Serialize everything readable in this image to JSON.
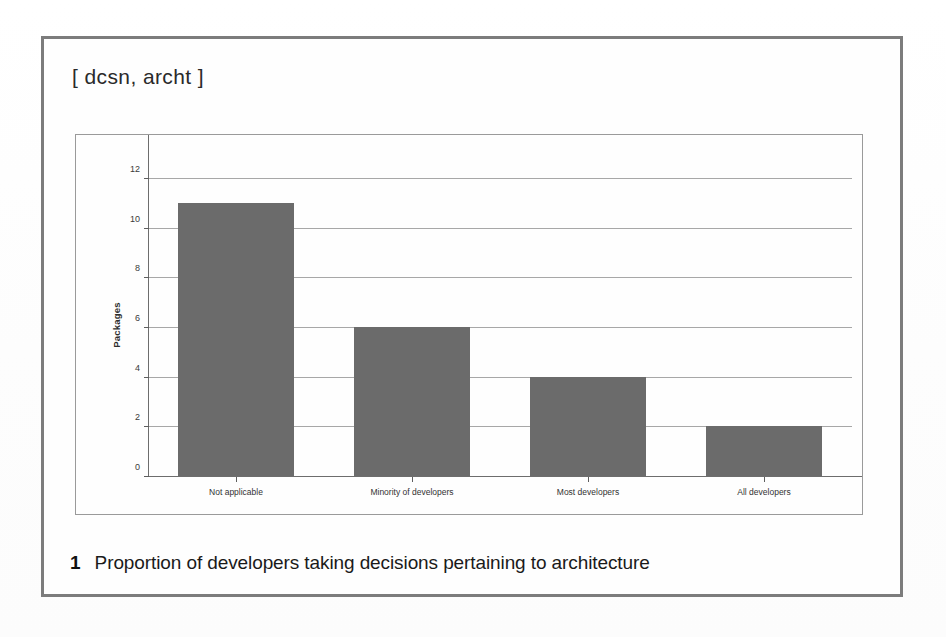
{
  "figure": {
    "bracket_label": "[ dcsn, archt ]",
    "caption_number": "1",
    "caption_text": "Proportion of developers taking decisions pertaining to architecture"
  },
  "colors": {
    "bar_fill": "#6b6b6b",
    "frame_border": "#7c7c7c",
    "chart_border": "#9a9a9a",
    "gridline": "#a7a7a7",
    "axis": "#6d6d6d",
    "page_background": "#ffffff"
  },
  "chart_data": {
    "type": "bar",
    "title": "",
    "subtitle": "",
    "categories": [
      "Not applicable",
      "Minority of developers",
      "Most developers",
      "All developers"
    ],
    "values": [
      11,
      6,
      4,
      2
    ],
    "xlabel": "",
    "ylabel": "Packages",
    "ylim": [
      0,
      13
    ],
    "yticks": [
      0,
      2,
      4,
      6,
      8,
      10,
      12
    ],
    "ytick_labels": [
      "0",
      "2",
      "4",
      "6",
      "8",
      "10",
      "12"
    ],
    "grid": true,
    "legend": false,
    "legend_position": "none",
    "orientation": "vertical"
  }
}
